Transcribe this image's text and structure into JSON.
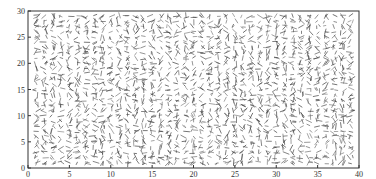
{
  "chart_data": {
    "type": "quiver",
    "title": "",
    "xlabel": "",
    "ylabel": "",
    "xlim": [
      0,
      40
    ],
    "ylim": [
      0,
      30
    ],
    "x_ticks": [
      0,
      5,
      10,
      15,
      20,
      25,
      30,
      35,
      40
    ],
    "y_ticks": [
      0,
      5,
      10,
      15,
      20,
      25,
      30
    ],
    "grid": false,
    "legend": null,
    "grid_spacing": 1,
    "segment_color": "#444444"
  },
  "axes": {
    "box": {
      "left": 28,
      "top": 11,
      "right": 359,
      "bottom": 168
    },
    "frame_color": "#333333"
  }
}
